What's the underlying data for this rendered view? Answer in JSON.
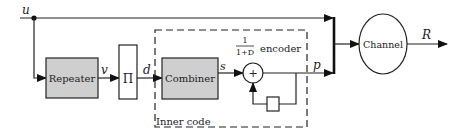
{
  "diagram": {
    "blocks": {
      "repeater": {
        "label": "Repeater",
        "fill": "#cfcfcf"
      },
      "interleaver": {
        "label": "Π",
        "fill": "#ffffff"
      },
      "combiner": {
        "label": "Combiner",
        "fill": "#cfcfcf"
      },
      "adder": {
        "label": "+"
      },
      "channel": {
        "label": "Channel"
      }
    },
    "encoder": {
      "numerator": "1",
      "denominator": "1+D",
      "label": "encoder"
    },
    "inner_code_label": "Inner code",
    "signals": {
      "u": "u",
      "v": "v",
      "d": "d",
      "s": "s",
      "p": "p",
      "R": "R"
    }
  }
}
